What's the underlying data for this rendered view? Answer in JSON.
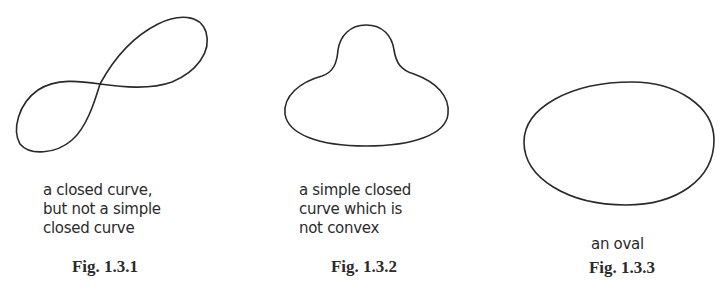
{
  "figures": [
    {
      "id": "fig-1-3-1",
      "label": "Fig. 1.3.1",
      "caption_lines": [
        "a closed curve,",
        "but not a simple",
        "closed curve"
      ],
      "shape": "figure-eight"
    },
    {
      "id": "fig-1-3-2",
      "label": "Fig. 1.3.2",
      "caption_lines": [
        "a simple closed",
        "curve which is",
        "not convex"
      ],
      "shape": "bell-shaped non-convex curve"
    },
    {
      "id": "fig-1-3-3",
      "label": "Fig. 1.3.3",
      "caption_lines": [
        "an oval"
      ],
      "shape": "oval"
    }
  ],
  "colors": {
    "stroke": "#2a2a2a",
    "text": "#2b2b2b",
    "background": "#ffffff"
  }
}
